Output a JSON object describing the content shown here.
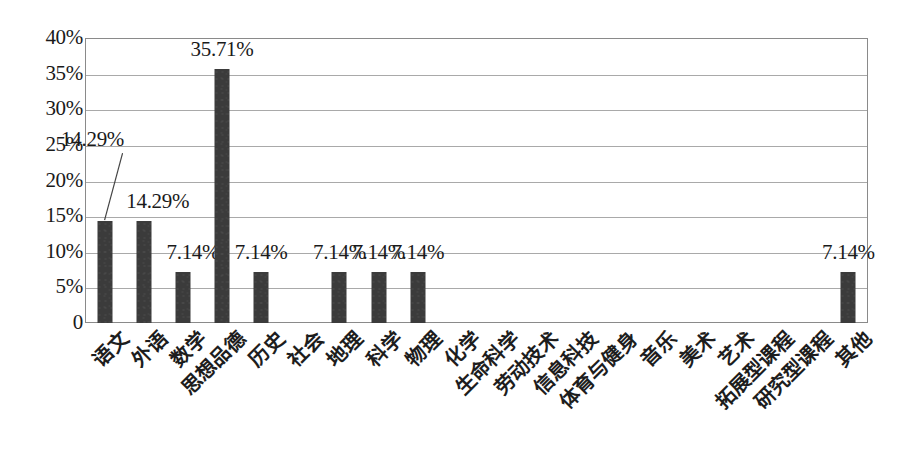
{
  "chart_data": {
    "type": "bar",
    "title": "",
    "xlabel": "",
    "ylabel": "",
    "ylim": [
      0,
      40
    ],
    "ytick_values": [
      40,
      35,
      30,
      25,
      20,
      15,
      10,
      5,
      0
    ],
    "ytick_labels": [
      "40%",
      "35%",
      "30%",
      "25%",
      "20%",
      "15%",
      "10%",
      "5%",
      "0"
    ],
    "grid": true,
    "legend": "none",
    "bar_color": "#3b3b3b",
    "categories": [
      "语文",
      "外语",
      "数学",
      "思想品德",
      "历史",
      "社会",
      "地理",
      "科学",
      "物理",
      "化学",
      "生命科学",
      "劳动技术",
      "信息科技",
      "体育与健身",
      "音乐",
      "美术",
      "艺术",
      "拓展型课程",
      "研究型课程",
      "其他"
    ],
    "values": [
      14.29,
      14.29,
      7.14,
      35.71,
      7.14,
      0,
      7.14,
      7.14,
      7.14,
      0,
      0,
      0,
      0,
      0,
      0,
      0,
      0,
      0,
      0,
      7.14
    ],
    "point_labels": [
      "14.29%",
      "14.29%",
      "7.14%",
      "35.71%",
      "7.14%",
      "",
      "7.14%",
      "7.14%",
      "7.14%",
      "",
      "",
      "",
      "",
      "",
      "",
      "",
      "",
      "",
      "",
      "7.14%"
    ],
    "label_offsets": [
      {
        "dx": -12,
        "dy": -92,
        "leader": true
      },
      {
        "dx": 14,
        "dy": -30,
        "leader": false
      },
      {
        "dx": 10,
        "dy": -30,
        "leader": false
      },
      {
        "dx": 0,
        "dy": -30,
        "leader": false
      },
      {
        "dx": 0,
        "dy": -30,
        "leader": false
      },
      null,
      {
        "dx": 0,
        "dy": -30,
        "leader": false
      },
      {
        "dx": 0,
        "dy": -30,
        "leader": false
      },
      {
        "dx": 0,
        "dy": -30,
        "leader": false
      },
      null,
      null,
      null,
      null,
      null,
      null,
      null,
      null,
      null,
      null,
      {
        "dx": 0,
        "dy": -30,
        "leader": false
      }
    ]
  }
}
